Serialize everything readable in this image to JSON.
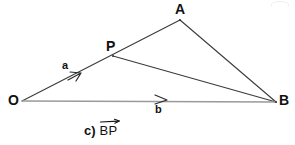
{
  "figure": {
    "width": 295,
    "height": 145,
    "background_color": "#ffffff",
    "stroke_color": "#3b3b3b",
    "light_stroke_color": "#9a9a9a",
    "text_color": "#111111"
  },
  "points": {
    "O": {
      "label": "O",
      "x": 22,
      "y": 101
    },
    "P": {
      "label": "P",
      "x": 113,
      "y": 56
    },
    "A": {
      "label": "A",
      "x": 180,
      "y": 20
    },
    "B": {
      "label": "B",
      "x": 276,
      "y": 102
    }
  },
  "segments": [
    {
      "name": "O-to-A-through-P",
      "from": "O",
      "to": "A",
      "color": "#3b3b3b"
    },
    {
      "name": "P-to-B",
      "from": "P",
      "to": "B",
      "color": "#3b3b3b"
    },
    {
      "name": "A-to-B",
      "from": "A",
      "to": "B",
      "color": "#3b3b3b"
    },
    {
      "name": "O-to-B",
      "from": "O",
      "to": "B",
      "color": "#9a9a9a"
    }
  ],
  "vectors": [
    {
      "name": "vector-a",
      "label": "a",
      "on_segment": "O-to-A-through-P",
      "arrow_tip_x": 80,
      "arrow_tip_y": 74,
      "label_x": 62,
      "label_y": 60
    },
    {
      "name": "vector-b",
      "label": "b",
      "on_segment": "O-to-B",
      "arrow_tip_x": 166,
      "arrow_tip_y": 100,
      "label_x": 155,
      "label_y": 104
    }
  ],
  "caption": {
    "marker": "c)",
    "vector_text": "BP",
    "has_overline_arrow": true
  }
}
